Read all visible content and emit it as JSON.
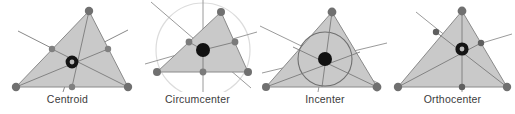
{
  "figure": {
    "type": "diagram",
    "background": "#ffffff",
    "panel_count": 4
  },
  "style": {
    "triangle_fill": "#c9c9c9",
    "triangle_stroke": "#8a8a8a",
    "cevian_line_color": "#7a7a7a",
    "vertex_dot_color": "#808080",
    "foot_dot_color": "#6e6e6e",
    "center_dot_color": "#111111",
    "center_ring_color": "#b9b9b9",
    "circumcircle_color": "#dcdcdc",
    "incircle_color": "#6f6f6f",
    "label_color": "#3b3b3b"
  },
  "panels": [
    {
      "id": "centroid",
      "label": "Centroid",
      "center_marker": "ring-dot",
      "construction": "medians",
      "circle": "none",
      "triangle": {
        "vertices": [
          [
            16,
            87
          ],
          [
            89,
            11
          ],
          [
            128,
            87
          ]
        ],
        "midpoints": [
          [
            52,
            49
          ],
          [
            108,
            49
          ],
          [
            72,
            87
          ]
        ],
        "center": [
          72,
          62
        ]
      }
    },
    {
      "id": "circumcenter",
      "label": "Circumcenter",
      "center_marker": "solid-dot",
      "construction": "perpendicular-bisectors",
      "circle": "circumscribed",
      "triangle": {
        "vertices": [
          [
            22,
            72
          ],
          [
            86,
            12
          ],
          [
            113,
            72
          ]
        ],
        "midpoints": [
          [
            54,
            42
          ],
          [
            100,
            42
          ],
          [
            68,
            72
          ]
        ],
        "center": [
          68,
          50
        ],
        "circumradius": 47
      }
    },
    {
      "id": "incenter",
      "label": "Incenter",
      "center_marker": "solid-dot",
      "construction": "angle-bisectors",
      "circle": "inscribed",
      "triangle": {
        "vertices": [
          [
            6,
            87
          ],
          [
            72,
            12
          ],
          [
            117,
            87
          ]
        ],
        "center": [
          65,
          59
        ],
        "inradius": 27
      }
    },
    {
      "id": "orthocenter",
      "label": "Orthocenter",
      "center_marker": "ring-dot",
      "construction": "altitudes",
      "circle": "none",
      "triangle": {
        "vertices": [
          [
            8,
            87
          ],
          [
            72,
            11
          ],
          [
            117,
            87
          ]
        ],
        "feet": [
          [
            46,
            32
          ],
          [
            91,
            43
          ],
          [
            72,
            87
          ]
        ],
        "center": [
          72,
          49
        ]
      }
    }
  ]
}
